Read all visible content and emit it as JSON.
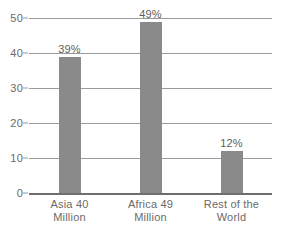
{
  "chart_data": {
    "type": "bar",
    "title": "",
    "subtitle": "",
    "xlabel": "",
    "ylabel": "",
    "ylim": [
      0,
      50
    ],
    "yticks": [
      0,
      10,
      20,
      30,
      40,
      50
    ],
    "ytick_labels": [
      "0",
      "10",
      "20",
      "30",
      "40",
      "50"
    ],
    "grid": true,
    "legend": false,
    "legend_position": "none",
    "categories": [
      "Asia 40 Million",
      "Africa 49 Million",
      "Rest of the World"
    ],
    "category_lines": [
      [
        "Asia 40",
        "Million"
      ],
      [
        "Africa 49",
        "Million"
      ],
      [
        "Rest of the",
        "World"
      ]
    ],
    "values": [
      39,
      49,
      12
    ],
    "data_labels": [
      "39%",
      "49%",
      "12%"
    ],
    "bar_color": "#8a8a8a",
    "gridline_color": "#9a9a9a",
    "axis_color": "#6e6e6e",
    "text_color": "#6a6a6a",
    "background_color": "#ffffff"
  }
}
